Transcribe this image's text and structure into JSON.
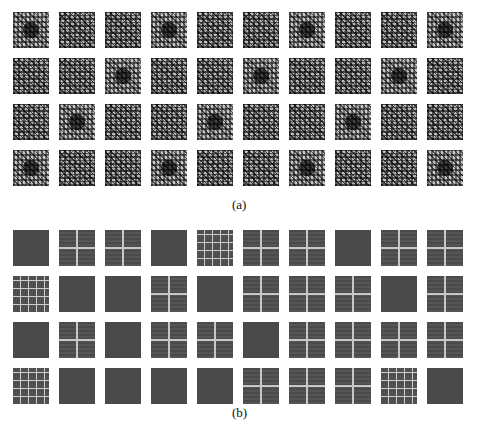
{
  "figure": {
    "panels": [
      {
        "label": "(a)",
        "rows": 4,
        "cols": 10,
        "description": "grid of recurrence-plot-like textured matrices (light gray)"
      },
      {
        "label": "(b)",
        "rows": 4,
        "cols": 10,
        "description": "grid of dark block matrices with light grid lines"
      }
    ]
  },
  "captions": {
    "a": "(a)",
    "b": "(b)"
  }
}
